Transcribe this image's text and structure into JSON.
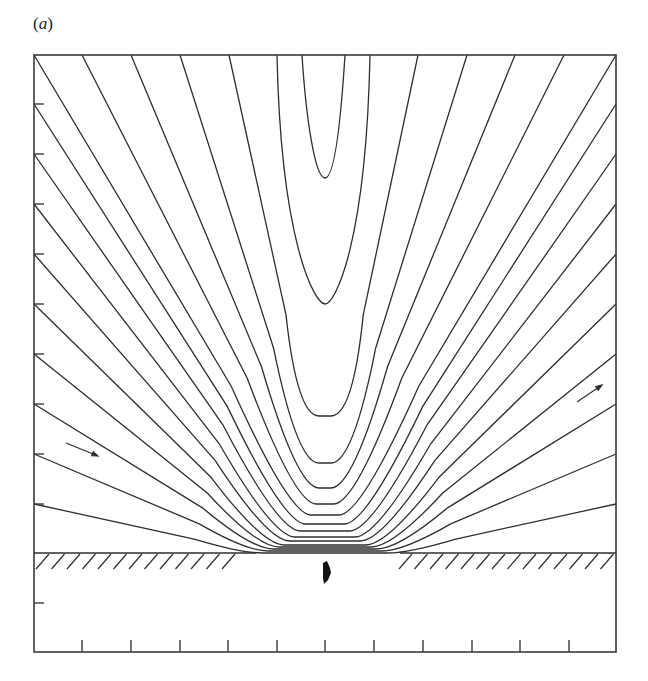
{
  "figure": {
    "panel_label": "a",
    "colors": {
      "line": "#2e2e2e",
      "background": "#ffffff",
      "body": "#111111"
    },
    "frame": {
      "left": 34,
      "top": 55,
      "right": 616,
      "bottom": 652
    },
    "left_ticks_y": [
      104,
      154,
      204,
      254,
      304,
      354,
      404,
      454,
      504,
      603
    ],
    "bottom_ticks_x": [
      82,
      131,
      180,
      228,
      277,
      325,
      374,
      423,
      472,
      520,
      569
    ],
    "wall": {
      "y": 553,
      "left_segment": [
        34,
        256
      ],
      "right_segment": [
        400,
        616
      ],
      "gap": [
        256,
        400
      ]
    },
    "streamline_count": 16,
    "streamline_vertex_y": [
      178,
      304,
      416,
      463,
      488,
      504,
      515,
      524,
      531,
      537,
      541,
      545,
      547,
      549,
      551,
      553
    ],
    "arrows": [
      {
        "name": "inflow-arrow-left",
        "from": [
          66,
          443
        ],
        "to": [
          98,
          456
        ]
      },
      {
        "name": "outflow-arrow-right",
        "from": [
          577,
          402
        ],
        "to": [
          602,
          385
        ]
      }
    ],
    "object_below_gap": {
      "x": 326,
      "y": 572
    }
  }
}
